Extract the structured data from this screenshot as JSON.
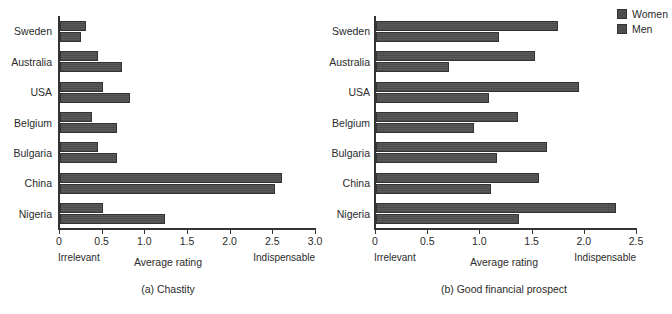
{
  "figure": {
    "legend": {
      "position": "top-right",
      "entries": [
        {
          "label": "Women",
          "color": "#4d4d4d"
        },
        {
          "label": "Men",
          "color": "#4d4d4d"
        }
      ]
    }
  },
  "panels": [
    {
      "id": "a",
      "caption": "(a) Chastity",
      "axis_title": "Average rating",
      "anchor_low": "Irrelevant",
      "anchor_high": "Indispensable",
      "tick_labels": [
        "0",
        "0.5",
        "1.0",
        "1.5",
        "2.0",
        "2.5",
        "3.0"
      ]
    },
    {
      "id": "b",
      "caption": "(b) Good financial prospect",
      "axis_title": "Average rating",
      "anchor_low": "Irrelevant",
      "anchor_high": "Indispensable",
      "tick_labels": [
        "0",
        "0.5",
        "1.0",
        "1.5",
        "2.0",
        "2.5"
      ]
    }
  ],
  "chart_data": [
    {
      "type": "bar",
      "orientation": "horizontal",
      "title": "(a) Chastity",
      "xlabel": "Average rating",
      "ylabel": "",
      "xlim": [
        0,
        3.0
      ],
      "xticks": [
        0,
        0.5,
        1.0,
        1.5,
        2.0,
        2.5,
        3.0
      ],
      "xtick_labels": [
        "0",
        "0.5",
        "1.0",
        "1.5",
        "2.0",
        "2.5",
        "3.0"
      ],
      "xaxis_anchor_low": "Irrelevant",
      "xaxis_anchor_high": "Indispensable",
      "grid": false,
      "legend_position": "top-right (shared)",
      "categories": [
        "Sweden",
        "Australia",
        "USA",
        "Belgium",
        "Bulgaria",
        "China",
        "Nigeria"
      ],
      "series": [
        {
          "name": "Women",
          "values": [
            0.3,
            0.45,
            0.5,
            0.37,
            0.44,
            2.6,
            0.5
          ]
        },
        {
          "name": "Men",
          "values": [
            0.25,
            0.73,
            0.82,
            0.67,
            0.67,
            2.52,
            1.23
          ]
        }
      ]
    },
    {
      "type": "bar",
      "orientation": "horizontal",
      "title": "(b) Good financial prospect",
      "xlabel": "Average rating",
      "ylabel": "",
      "xlim": [
        0,
        2.5
      ],
      "xticks": [
        0,
        0.5,
        1.0,
        1.5,
        2.0,
        2.5
      ],
      "xtick_labels": [
        "0",
        "0.5",
        "1.0",
        "1.5",
        "2.0",
        "2.5"
      ],
      "xaxis_anchor_low": "Irrelevant",
      "xaxis_anchor_high": "Indispensable",
      "grid": false,
      "legend_position": "top-right (shared)",
      "categories": [
        "Sweden",
        "Australia",
        "USA",
        "Belgium",
        "Bulgaria",
        "China",
        "Nigeria"
      ],
      "series": [
        {
          "name": "Women",
          "values": [
            1.74,
            1.52,
            1.94,
            1.36,
            1.64,
            1.56,
            2.3
          ]
        },
        {
          "name": "Men",
          "values": [
            1.18,
            0.7,
            1.08,
            0.94,
            1.16,
            1.1,
            1.37
          ]
        }
      ]
    }
  ]
}
